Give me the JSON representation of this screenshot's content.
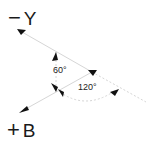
{
  "diagram": {
    "axes": {
      "negative_y": {
        "sign": "−",
        "name": "Y"
      },
      "positive_b": {
        "sign": "+",
        "name": "B"
      }
    },
    "angles": [
      {
        "id": "angle-60",
        "label": "60°"
      },
      {
        "id": "angle-120",
        "label": "120°"
      }
    ],
    "colors": {
      "line": "#d4d4d4",
      "arrow": "#111111",
      "text": "#1a1a1a",
      "background": "#ffffff"
    }
  }
}
